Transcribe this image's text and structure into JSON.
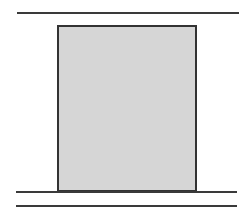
{
  "diagram": {
    "colors": {
      "line": "#3a3a3a",
      "block_border": "#333333",
      "block_fill": "#d6d6d6",
      "background": "#ffffff"
    },
    "elements": {
      "top_line": {
        "x1": 17,
        "x2": 239,
        "y": 12,
        "thickness": 1.5
      },
      "block": {
        "left": 57,
        "top": 25,
        "right": 197,
        "bottom": 192
      },
      "surface_line": {
        "x1": 16,
        "x2": 237,
        "y": 191,
        "thickness": 2
      },
      "bottom_line": {
        "x1": 16,
        "x2": 237,
        "y": 205,
        "thickness": 1.5
      }
    }
  }
}
